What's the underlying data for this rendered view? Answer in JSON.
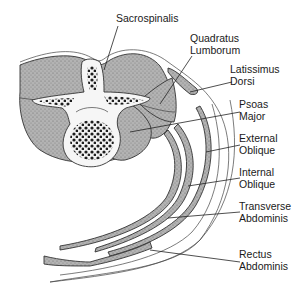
{
  "labels": {
    "sacrospinalis": [
      "Sacrospinalis"
    ],
    "quadratus_lumborum": [
      "Quadratus",
      "Lumborum"
    ],
    "latissimus_dorsi": [
      "Latissimus",
      "Dorsi"
    ],
    "psoas_major": [
      "Psoas",
      "Major"
    ],
    "external_oblique": [
      "External",
      "Oblique"
    ],
    "internal_oblique": [
      "Internal",
      "Oblique"
    ],
    "transverse_abdominis": [
      "Transverse",
      "Abdominis"
    ],
    "rectus_abdominis": [
      "Rectus",
      "Abdominis"
    ]
  },
  "colors": {
    "muscle_fill": "#a9a9a9",
    "bone_dark": "#2b2b2b",
    "bone_light": "#f4f4f4",
    "line": "#222222"
  }
}
